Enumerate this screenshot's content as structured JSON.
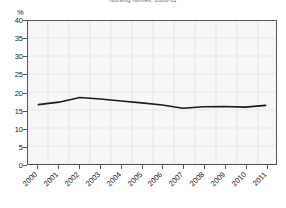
{
  "chart_data": {
    "type": "line",
    "title": "Nursing homes, 2000-11",
    "unit_label": "%",
    "xlabel": "",
    "ylabel": "%",
    "categories": [
      "2000",
      "2001",
      "2002",
      "2003",
      "2004",
      "2005",
      "2006",
      "2007",
      "2008",
      "2009",
      "2010",
      "2011"
    ],
    "x": [
      2000,
      2001,
      2002,
      2003,
      2004,
      2005,
      2006,
      2007,
      2008,
      2009,
      2010,
      2011
    ],
    "values": [
      16.6,
      17.3,
      18.6,
      18.2,
      17.6,
      17.1,
      16.5,
      15.6,
      16.0,
      16.1,
      15.9,
      16.4
    ],
    "series": [
      {
        "name": "Nursing homes",
        "values": [
          16.6,
          17.3,
          18.6,
          18.2,
          17.6,
          17.1,
          16.5,
          15.6,
          16.0,
          16.1,
          15.9,
          16.4
        ]
      }
    ],
    "ylim": [
      0,
      40
    ],
    "yticks": [
      0,
      5,
      10,
      15,
      20,
      25,
      30,
      35,
      40
    ],
    "ytick_labels": [
      "0",
      "5",
      "10",
      "15",
      "20",
      "25",
      "30",
      "35",
      "40"
    ],
    "grid": true,
    "legend": "none",
    "line_color": "#1a1a1a",
    "plot_bg": "#f7f7f7",
    "frame_color": "#555555"
  }
}
